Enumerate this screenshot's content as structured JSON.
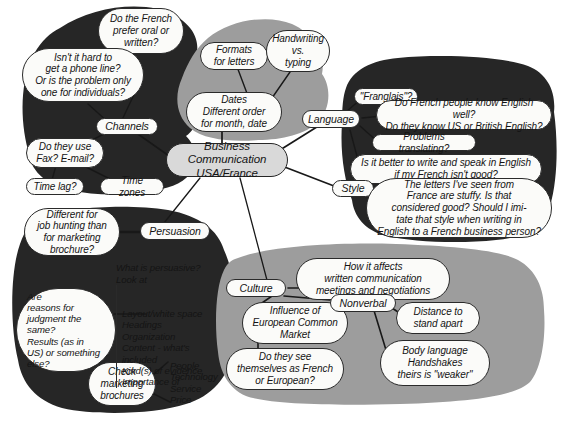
{
  "diagram": {
    "style": {
      "dark_blob": "#262626",
      "gray_blob": "#9d9d9d",
      "bubble_fill": "#fbfbf9",
      "center_fill": "#d9d9d9",
      "stroke": "#2a2a2a",
      "background": "#ffffff"
    },
    "center": {
      "label": "Business Communication\nUSA/France"
    },
    "clusters": [
      {
        "name": "channels",
        "shade": "dark",
        "category": "Channels",
        "nodes": [
          "Do the French\nprefer oral or\nwritten?",
          "Isn't it hard to\nget a phone line?\nOr is the problem only\none for individuals?",
          "Do they use\nFax? E-mail?",
          "Time lag?",
          "Time zones"
        ]
      },
      {
        "name": "formats",
        "shade": "gray",
        "category": "",
        "nodes": [
          "Formats\nfor letters",
          "Handwriting\nvs.\ntyping",
          "Dates\nDifferent order\nfor month, date"
        ]
      },
      {
        "name": "language-style",
        "shade": "dark",
        "category": "Language",
        "category2": "Style",
        "nodes": [
          "\"Franglais\"?",
          "Do French people know English well?\nDo they know US or British English?",
          "Problems translating?",
          "Is it better to write and speak in English\nif my French isn't good?",
          "The letters I've seen from\nFrance are stuffy. Is that\nconsidered good? Should I imi-\ntate that style when writing in\nEnglish to a French business person?"
        ]
      },
      {
        "name": "persuasion",
        "shade": "dark",
        "category": "Persuasion",
        "nodes": [
          "Different for\njob hunting than\nfor marketing\nbrochure?",
          "Are\nreasons for\njudgment the\nsame?\nResults (as in\nUS) or something\nelse?",
          "Check\nmarketing\nbrochures"
        ],
        "plain_blocks": [
          {
            "name": "persuasive-checklist",
            "header": "What is persuasive?\nLook at",
            "items": "Layout/white space\nHeadings\nOrganization\nContent - what's\nincluded\nKind(s) of evidence\nImportance of"
          },
          {
            "name": "persuasion-factors",
            "items": "People\nTechnology\nService\nPrice"
          }
        ]
      },
      {
        "name": "culture",
        "shade": "gray",
        "category": "Culture",
        "category2": "Nonverbal",
        "nodes": [
          "How it affects\nwritten communication\nmeetings and negotiations",
          "Influence of\nEuropean Common\nMarket",
          "Do they see\nthemselves as French\nor European?",
          "Distance to\nstand apart",
          "Body language\nHandshakes\ntheirs is \"weaker\""
        ]
      }
    ],
    "labels": {
      "channels": "Channels",
      "language": "Language",
      "style": "Style",
      "persuasion": "Persuasion",
      "culture": "Culture",
      "nonverbal": "Nonverbal",
      "center": "Business Communication\nUSA/France",
      "n_french_oral": "Do the French\nprefer oral or\nwritten?",
      "n_phone_line": "Isn't it hard to\nget a phone line?\nOr is the problem only\none for individuals?",
      "n_fax_email": "Do they use\nFax? E-mail?",
      "n_time_lag": "Time lag?",
      "n_time_zones": "Time zones",
      "n_formats": "Formats\nfor letters",
      "n_handwriting": "Handwriting\nvs.\ntyping",
      "n_dates": "Dates\nDifferent order\nfor month, date",
      "n_franglais": "\"Franglais\"?",
      "n_know_english": "Do French people know English well?\nDo they know US or British English?",
      "n_translating": "Problems translating?",
      "n_better_write": "Is it better to write and speak in English\nif my French isn't good?",
      "n_letters_stuffy": "The letters I've seen from\nFrance are stuffy. Is that\nconsidered good? Should I imi-\ntate that style when writing in\nEnglish to a French business person?",
      "n_job_hunting": "Different for\njob hunting than\nfor marketing\nbrochure?",
      "n_reasons": "Are\nreasons for\njudgment the\nsame?\nResults (as in\nUS) or something\nelse?",
      "n_check_brochures": "Check\nmarketing\nbrochures",
      "p_persuasive_header": "What is persuasive?\nLook at",
      "p_persuasive_items": "Layout/white space\nHeadings\nOrganization\nContent - what's\nincluded\nKind(s) of evidence\nImportance of",
      "p_factors": "People\nTechnology\nService\nPrice",
      "n_how_affects": "How it affects\nwritten communication\nmeetings and negotiations",
      "n_influence": "Influence of\nEuropean Common\nMarket",
      "n_themselves": "Do they see\nthemselves as French\nor European?",
      "n_distance": "Distance to\nstand apart",
      "n_body_language": "Body language\nHandshakes\ntheirs is \"weaker\""
    }
  }
}
